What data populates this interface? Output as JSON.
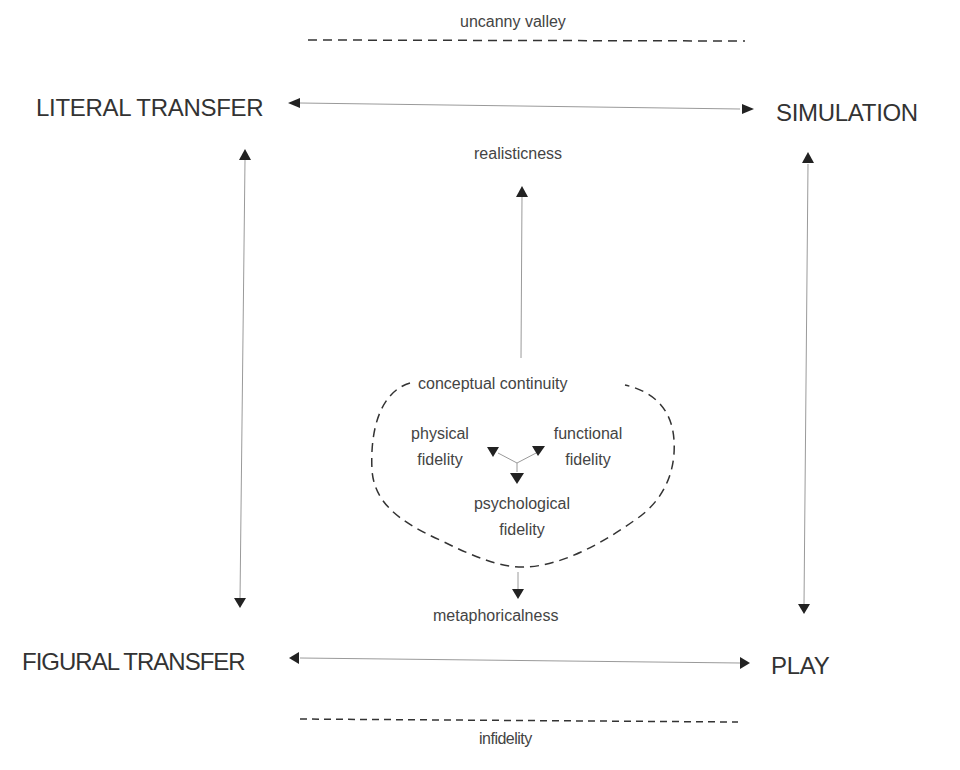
{
  "corners": {
    "top_left": "LITERAL TRANSFER",
    "top_right": "SIMULATION",
    "bottom_left": "FIGURAL TRANSFER",
    "bottom_right": "PLAY"
  },
  "boundaries": {
    "top": "uncanny valley",
    "bottom": "infidelity"
  },
  "axis": {
    "up": "realisticness",
    "down": "metaphoricalness"
  },
  "cluster": {
    "title": "conceptual continuity",
    "physical": [
      "physical",
      "fidelity"
    ],
    "functional": [
      "functional",
      "fidelity"
    ],
    "psychological": [
      "psychological",
      "fidelity"
    ]
  },
  "colors": {
    "line": "#9a9a9a",
    "arrowhead": "#222222",
    "dashed": "#333333",
    "text": "#3a3a3a"
  }
}
